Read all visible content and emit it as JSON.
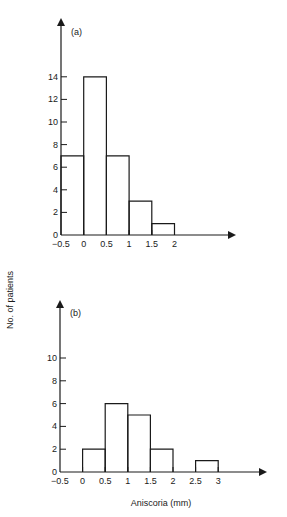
{
  "figure": {
    "ylabel": "No. of patients",
    "xlabel": "Aniscoria (mm)"
  },
  "chart_data": [
    {
      "type": "bar",
      "panel": "(a)",
      "title": "(a)",
      "xlabel": "Aniscoria (mm)",
      "ylabel": "No. of patients",
      "bin_edges": [
        -0.5,
        0,
        0.5,
        1,
        1.5,
        2
      ],
      "categories": [
        "-0.5–0",
        "0–0.5",
        "0.5–1",
        "1–1.5",
        "1.5–2"
      ],
      "values": [
        7,
        14,
        7,
        3,
        1
      ],
      "x_ticks": [
        "−0.5",
        "0",
        "0.5",
        "1",
        "1.5",
        "2"
      ],
      "x_tick_values": [
        -0.5,
        0,
        0.5,
        1,
        1.5,
        2
      ],
      "y_ticks": [
        "0",
        "2",
        "4",
        "6",
        "8",
        "10",
        "12",
        "14"
      ],
      "y_tick_values": [
        0,
        2,
        4,
        6,
        8,
        10,
        12,
        14
      ],
      "ylim": [
        0,
        19
      ],
      "grid": false,
      "style": "step histogram outline"
    },
    {
      "type": "bar",
      "panel": "(b)",
      "title": "(b)",
      "xlabel": "Aniscoria (mm)",
      "ylabel": "No. of patients",
      "bin_edges": [
        0,
        0.5,
        1,
        1.5,
        2,
        2.5,
        3
      ],
      "categories": [
        "0–0.5",
        "0.5–1",
        "1–1.5",
        "1.5–2",
        "2–2.5",
        "2.5–3"
      ],
      "values": [
        2,
        6,
        5,
        2,
        0,
        1
      ],
      "x_ticks": [
        "−0.5",
        "0",
        "0.5",
        "1",
        "1.5",
        "2",
        "2.5",
        "3"
      ],
      "x_tick_values": [
        -0.5,
        0,
        0.5,
        1,
        1.5,
        2,
        2.5,
        3
      ],
      "y_ticks": [
        "0",
        "2",
        "4",
        "6",
        "8",
        "10"
      ],
      "y_tick_values": [
        0,
        2,
        4,
        6,
        8,
        10
      ],
      "ylim": [
        0,
        15
      ],
      "grid": false,
      "style": "step histogram outline"
    }
  ]
}
